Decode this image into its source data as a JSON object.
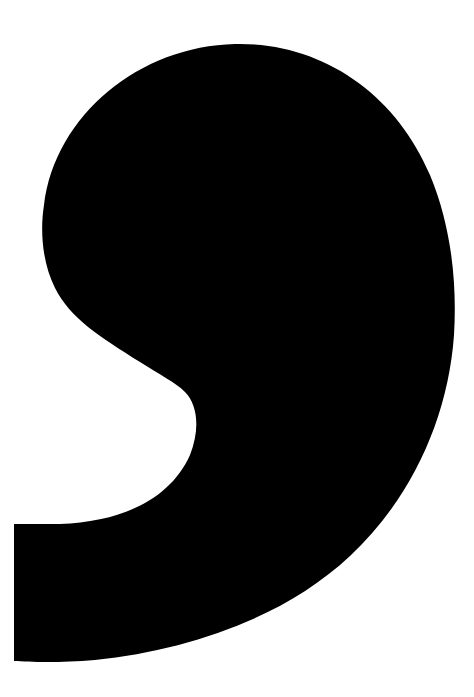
{
  "image": {
    "width": 474,
    "height": 697,
    "background": "#ffffff",
    "glyph": {
      "name": "comma",
      "character": ",",
      "fill": "#000000"
    }
  }
}
